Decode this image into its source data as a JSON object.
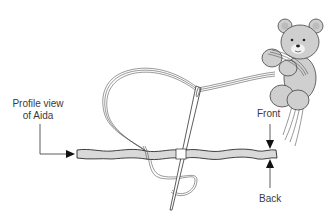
{
  "labels": {
    "profile_line1": "Profile view",
    "profile_line2": "of Aida",
    "front": "Front",
    "back": "Back"
  },
  "colors": {
    "fabric_fill": "#d9d9d9",
    "outline": "#2b2b2b",
    "bear_fill": "#cfcfcf",
    "thread": "#555555",
    "background": "#ffffff"
  },
  "figure": {
    "parts": [
      "profile-of-aida-fabric",
      "needle",
      "embroidery-thread",
      "teddy-bear",
      "front-arrow",
      "back-arrow",
      "profile-callout-arrow"
    ]
  }
}
